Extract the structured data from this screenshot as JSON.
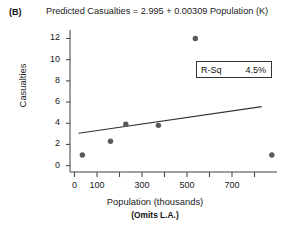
{
  "panel": {
    "letter": "(B)"
  },
  "chart_data": {
    "type": "scatter",
    "title": "Predicted Casualties = 2.995 + 0.00309 Population (K)",
    "xlabel": "Population (thousands)",
    "xlabel_note": "(Omits L.A.)",
    "ylabel": "Casualties",
    "xlim": [
      -20,
      900
    ],
    "ylim": [
      -0.6,
      12.8
    ],
    "grid": false,
    "legend": null,
    "x_major_ticks": [
      0,
      100,
      300,
      500,
      700
    ],
    "x_minor_ticks": [
      200,
      400,
      600,
      800
    ],
    "x_tick_labels": [
      "0",
      "100",
      "300",
      "500",
      "700"
    ],
    "y_ticks": [
      0,
      2,
      4,
      6,
      8,
      10,
      12
    ],
    "y_tick_labels": [
      "0",
      "2",
      "4",
      "6",
      "8",
      "10",
      "12"
    ],
    "points": [
      {
        "x": 35,
        "y": 1.0
      },
      {
        "x": 160,
        "y": 2.3
      },
      {
        "x": 228,
        "y": 3.9
      },
      {
        "x": 373,
        "y": 3.8
      },
      {
        "x": 537,
        "y": 12.0
      },
      {
        "x": 877,
        "y": 1.0
      }
    ],
    "marker_color": "#595959",
    "marker_size": 4,
    "fit_line": {
      "intercept": 2.995,
      "slope": 0.00309,
      "x_start": 18,
      "x_end": 832,
      "color": "#333333",
      "equation": "Predicted Casualties = 2.995 + 0.00309 Population (K)"
    },
    "annotation": {
      "r_sq_label": "R-Sq",
      "r_sq_value": "4.5%"
    },
    "axis_color": "#4d4d4d"
  }
}
